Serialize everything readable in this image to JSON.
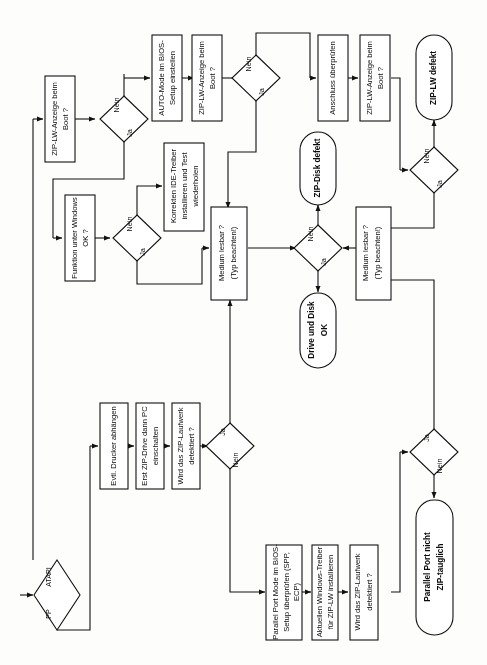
{
  "diagram": {
    "language": "de",
    "orientation": "rotated-90-ccw",
    "accent_color": "#111111",
    "background_color": "#fdfdfc"
  },
  "nodes": {
    "start_arrow": {
      "label": ""
    },
    "d_atapi": {
      "label_left": "PP",
      "label_right": "ATAPI"
    },
    "b_zip_anzeige_1": {
      "label": "ZIP-LW-Anzeige beim Boot ?"
    },
    "d_anzeige_1": {
      "yes": "Ja",
      "no": "Nein"
    },
    "b_auto_mode": {
      "label": "AUTO-Mode im BIOS-Setup einstellen"
    },
    "b_zip_anzeige_2": {
      "label": "ZIP-LW-Anzeige beim Boot ?"
    },
    "d_anzeige_2": {
      "yes": "Ja",
      "no": "Nein"
    },
    "b_anschluss": {
      "label": "Anschluss überprüfen"
    },
    "b_zip_anzeige_3": {
      "label": "ZIP-LW-Anzeige beim Boot ?"
    },
    "d_anzeige_3": {
      "yes": "Ja",
      "no": "Nein"
    },
    "t_zip_lw_defekt": {
      "label": "ZIP-LW defekt"
    },
    "b_funktion_windows": {
      "label": "Funktion unter Windows OK ?"
    },
    "d_funktion": {
      "yes": "Ja",
      "no": "Nein"
    },
    "b_ide_treiber": {
      "label": "Korrekten IDE-Treiber installieren und Test wiederholen"
    },
    "b_medium_left": {
      "line1": "Medium lesbar ?",
      "line2": "(Typ beachten!)"
    },
    "d_medium": {
      "yes": "Ja",
      "no": "Nein"
    },
    "t_zip_disk_defekt": {
      "label": "ZIP-Disk defekt"
    },
    "t_drive_disk_ok": {
      "line1": "Drive und Disk",
      "line2": "OK"
    },
    "b_medium_right": {
      "line1": "Medium lesbar ?",
      "line2": "(Typ beachten!)"
    },
    "b_drucker": {
      "label": "Evtl. Drucker abhängen"
    },
    "b_zip_drive_pc": {
      "label": "Erst ZIP-Drive dann PC einschalten"
    },
    "b_detektiert_1": {
      "label": "Wird das ZIP-Laufwerk detektiert ?"
    },
    "d_detektiert_1": {
      "yes": "Ja",
      "no": "Nein"
    },
    "b_parallel_mode": {
      "line1": "Parallel Port Mode im BIOS-",
      "line2": "Setup überprüfen (SPP,",
      "line3": "ECP)"
    },
    "b_win_treiber": {
      "line1": "Aktuellen Windows-Treiber",
      "line2": "für ZIP-LW installieren"
    },
    "b_detektiert_2": {
      "line1": "Wird das ZIP-Laufwerk",
      "line2": "detektiert ?"
    },
    "d_detektiert_2": {
      "yes": "Ja",
      "no": "Nein"
    },
    "t_parallel_nicht": {
      "line1": "Parallel Port nicht",
      "line2": "ZIP-tauglich"
    }
  }
}
